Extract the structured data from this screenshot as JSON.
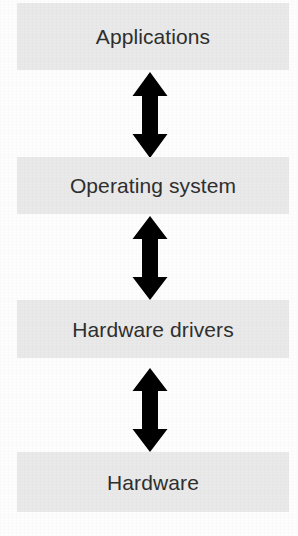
{
  "diagram": {
    "type": "layered-stack",
    "orientation": "vertical",
    "background_color": "#fdfdfd",
    "box_fill_color": "#e9e9e9",
    "text_color": "#2f2f2f",
    "arrow_color": "#000000",
    "layers": [
      {
        "id": "applications",
        "label": "Applications"
      },
      {
        "id": "operating-system",
        "label": "Operating system"
      },
      {
        "id": "hardware-drivers",
        "label": "Hardware drivers"
      },
      {
        "id": "hardware",
        "label": "Hardware"
      }
    ],
    "connectors": [
      {
        "id": "arrow-applications-operating-system",
        "icon": "double-headed-vertical-arrow-icon",
        "from": "Applications",
        "to": "Operating system"
      },
      {
        "id": "arrow-operating-system-hardware-drivers",
        "icon": "double-headed-vertical-arrow-icon",
        "from": "Operating system",
        "to": "Hardware drivers"
      },
      {
        "id": "arrow-hardware-drivers-hardware",
        "icon": "double-headed-vertical-arrow-icon",
        "from": "Hardware drivers",
        "to": "Hardware"
      }
    ]
  }
}
